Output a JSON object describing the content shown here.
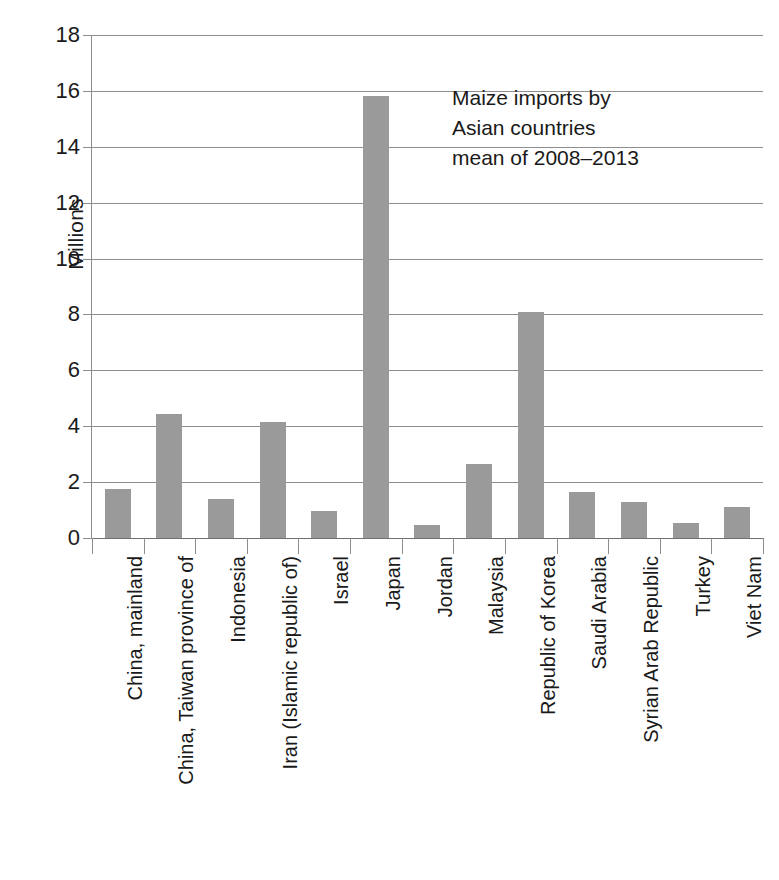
{
  "chart_data": {
    "type": "bar",
    "title": "",
    "xlabel": "",
    "ylabel": "Millions",
    "ylim": [
      0,
      18
    ],
    "ytick_step": 2,
    "yticks": [
      18,
      16,
      14,
      12,
      10,
      8,
      6,
      4,
      2,
      0
    ],
    "grid": true,
    "legend": false,
    "bar_color": "#9a9a9a",
    "annotation_lines": [
      "Maize imports by",
      "Asian countries",
      "mean of 2008–2013"
    ],
    "categories": [
      "China, mainland",
      "China, Taiwan province of",
      "Indonesia",
      "Iran (Islamic republic of)",
      "Israel",
      "Japan",
      "Jordan",
      "Malaysia",
      "Republic of Korea",
      "Saudi Arabia",
      "Syrian Arab Republic",
      "Turkey",
      "Viet Nam"
    ],
    "values": [
      1.75,
      4.45,
      1.38,
      4.15,
      0.95,
      15.8,
      0.45,
      2.65,
      8.1,
      1.65,
      1.3,
      0.53,
      1.1
    ]
  }
}
